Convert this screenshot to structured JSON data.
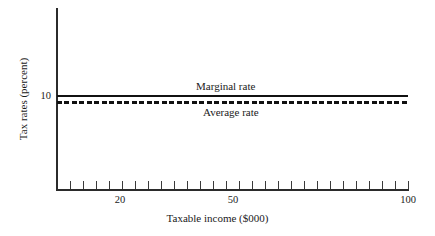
{
  "chart_data": {
    "type": "line",
    "title": "",
    "xlabel": "Taxable income ($000)",
    "ylabel": "Tax rates (percent)",
    "xscale": "log",
    "xlim": [
      15,
      100
    ],
    "ylim": [
      0,
      17
    ],
    "xticklabels": [
      "20",
      "50",
      "100"
    ],
    "yticklabels": [
      "10"
    ],
    "grid": false,
    "legend": "inline-annotations",
    "series": [
      {
        "name": "Marginal rate",
        "style": "solid",
        "color": "#111111",
        "x": [
          15,
          20,
          30,
          40,
          50,
          60,
          70,
          80,
          90,
          100
        ],
        "values": [
          10,
          10,
          10,
          10,
          10,
          10,
          10,
          10,
          10,
          10
        ]
      },
      {
        "name": "Average rate",
        "style": "dashed",
        "color": "#111111",
        "x": [
          15,
          20,
          30,
          40,
          50,
          60,
          70,
          80,
          90,
          100
        ],
        "values": [
          9.4,
          9.4,
          9.4,
          9.4,
          9.4,
          9.4,
          9.4,
          9.4,
          9.4,
          9.4
        ]
      }
    ],
    "annotations": [
      {
        "text": "Marginal rate",
        "x": 41,
        "y": 11.2
      },
      {
        "text": "Average rate",
        "x": 44,
        "y": 8.3
      }
    ]
  },
  "axes": {
    "y_tick_labels": [
      {
        "value": "10"
      }
    ],
    "x_tick_labels": [
      {
        "value": "20",
        "left": 120
      },
      {
        "value": "50",
        "left": 233
      },
      {
        "value": "100",
        "left": 408
      }
    ],
    "x_tick_marks": [
      {
        "left": 70
      },
      {
        "left": 83
      },
      {
        "left": 96
      },
      {
        "left": 109
      },
      {
        "left": 122
      },
      {
        "left": 135
      },
      {
        "left": 148
      },
      {
        "left": 161
      },
      {
        "left": 174
      },
      {
        "left": 187
      },
      {
        "left": 200
      },
      {
        "left": 213
      },
      {
        "left": 226
      },
      {
        "left": 239
      },
      {
        "left": 252
      },
      {
        "left": 265
      },
      {
        "left": 278
      },
      {
        "left": 291
      },
      {
        "left": 304
      },
      {
        "left": 317
      },
      {
        "left": 330
      },
      {
        "left": 343
      },
      {
        "left": 356
      },
      {
        "left": 369
      },
      {
        "left": 382
      },
      {
        "left": 395
      },
      {
        "left": 408
      }
    ]
  },
  "labels": {
    "axis_title_x": "Taxable income ($000)",
    "axis_title_y": "Tax rates (percent)",
    "marginal": "Marginal rate",
    "average": "Average rate",
    "y_tick_10": "10"
  }
}
